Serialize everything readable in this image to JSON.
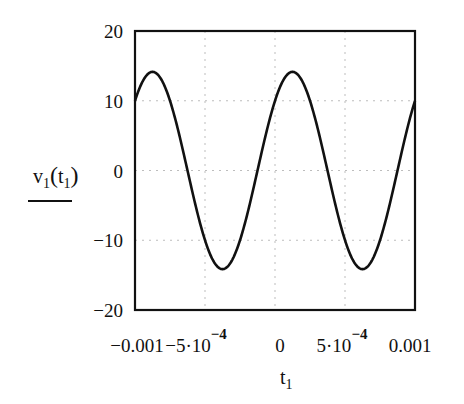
{
  "chart_data": {
    "type": "line",
    "title": "",
    "xlabel": "t1",
    "ylabel": "v1(t1)",
    "xlim": [
      -0.001,
      0.001
    ],
    "ylim": [
      -20,
      20
    ],
    "grid": true,
    "legend": "none (trace line drawn under y-axis label)",
    "x_ticks": [
      {
        "value": -0.001,
        "label": "-0.001"
      },
      {
        "value": -0.0005,
        "label": "-5·10^-4"
      },
      {
        "value": 0,
        "label": "0"
      },
      {
        "value": 0.0005,
        "label": "5·10^-4"
      },
      {
        "value": 0.001,
        "label": "0.001"
      }
    ],
    "y_ticks": [
      {
        "value": 20,
        "label": "20"
      },
      {
        "value": 10,
        "label": "10"
      },
      {
        "value": 0,
        "label": "0"
      },
      {
        "value": -10,
        "label": "-10"
      },
      {
        "value": -20,
        "label": "-20"
      }
    ],
    "series": [
      {
        "name": "v1(t1)",
        "color": "#111111",
        "function": "v1(t) = 14.14*sin(2*pi*1000*t + pi/4)",
        "amplitude": 14.14,
        "frequency_hz": 1000,
        "phase_rad": 0.785,
        "x": [
          -0.001,
          -0.000875,
          -0.00075,
          -0.000625,
          -0.0005,
          -0.000375,
          -0.00025,
          -0.000125,
          0,
          0.000125,
          0.00025,
          0.000375,
          0.0005,
          0.000625,
          0.00075,
          0.000875,
          0.001
        ],
        "values": [
          10,
          14.14,
          10,
          0,
          -10,
          -14.14,
          -10,
          0,
          10,
          14.14,
          10,
          0,
          -10,
          -14.14,
          -10,
          0,
          10
        ]
      }
    ]
  },
  "labels": {
    "y_axis_main": "v",
    "y_axis_sub1": "1",
    "y_axis_arg": "t",
    "y_axis_sub2": "1",
    "x_axis_main": "t",
    "x_axis_sub": "1"
  }
}
